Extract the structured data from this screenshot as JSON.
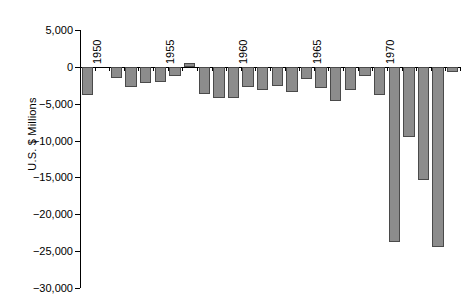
{
  "chart_data": {
    "type": "bar",
    "title": "",
    "xlabel": "",
    "ylabel": "U.S. $ Millions",
    "ylim": [
      -30000,
      5000
    ],
    "ytick_labels": [
      "5,000",
      "0",
      "−5,000",
      "−10,000",
      "−15,000",
      "−20,000",
      "−25,000",
      "−30,000"
    ],
    "ytick_values": [
      5000,
      0,
      -5000,
      -10000,
      -15000,
      -20000,
      -25000,
      -30000
    ],
    "grid": false,
    "legend": null,
    "xtick_labels": [
      "1950",
      "1955",
      "1960",
      "1965",
      "1970"
    ],
    "xtick_years": [
      1950,
      1955,
      1960,
      1965,
      1970
    ],
    "categories": [
      1950,
      1951,
      1952,
      1953,
      1954,
      1955,
      1956,
      1957,
      1958,
      1959,
      1960,
      1961,
      1962,
      1963,
      1964,
      1965,
      1966,
      1967,
      1968,
      1969,
      1970,
      1971,
      1972,
      1973,
      1974,
      1975
    ],
    "values": [
      -3800,
      0,
      -1500,
      -2800,
      -2200,
      -2000,
      -1200,
      500,
      -3700,
      -4200,
      -4200,
      -2700,
      -3200,
      -2600,
      -3400,
      -1600,
      -2900,
      -4700,
      -3200,
      -1300,
      -3800,
      -23800,
      -9500,
      -15400,
      -24400,
      -700
    ]
  },
  "axis": {
    "y_axis_label": "U.S. $ Millions"
  }
}
